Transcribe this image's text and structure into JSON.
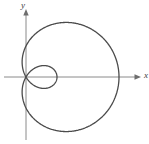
{
  "figure": {
    "name": "polar-limacon-plot",
    "width": 149,
    "height": 144,
    "background": "#ffffff"
  },
  "axes": {
    "x_axis": {
      "label": "x",
      "color": "#8a8a8a",
      "start_x": 4,
      "end_x": 141,
      "y": 77,
      "arrow": "right"
    },
    "y_axis": {
      "label": "y",
      "color": "#8a8a8a",
      "x": 26,
      "start_y": 140,
      "end_y": 9,
      "arrow": "up"
    },
    "origin": {
      "x": 26,
      "y": 77
    }
  },
  "curve": {
    "name": "limacon-with-inner-loop",
    "color": "#4b4b4b",
    "stroke_width": 1.3,
    "fill": "none"
  },
  "chart_data": {
    "type": "line",
    "title": "",
    "xlabel": "x",
    "ylabel": "y",
    "grid": false,
    "legend": null,
    "coordinate_system": "polar",
    "equation": "r = a + b cos(theta), b > a  (limacon with inner loop)",
    "parameters": {
      "a": 1,
      "b": 2
    },
    "pixels_per_unit": 31,
    "origin_px": [
      26,
      77
    ],
    "theta_range_deg": [
      0,
      360
    ],
    "outer_extent_px": {
      "left": 20,
      "right": 119,
      "top": 21,
      "bottom": 133
    },
    "inner_loop_extent_px": {
      "left": 26,
      "right": 58,
      "top": 62,
      "bottom": 92
    },
    "points_polar": [
      {
        "theta_deg": 0,
        "r": 3.0
      },
      {
        "theta_deg": 30,
        "r": 2.73
      },
      {
        "theta_deg": 60,
        "r": 2.0
      },
      {
        "theta_deg": 90,
        "r": 1.0
      },
      {
        "theta_deg": 120,
        "r": 0.0
      },
      {
        "theta_deg": 150,
        "r": -0.73
      },
      {
        "theta_deg": 180,
        "r": -1.0
      },
      {
        "theta_deg": 210,
        "r": -0.73
      },
      {
        "theta_deg": 240,
        "r": 0.0
      },
      {
        "theta_deg": 270,
        "r": 1.0
      },
      {
        "theta_deg": 300,
        "r": 2.0
      },
      {
        "theta_deg": 330,
        "r": 2.73
      },
      {
        "theta_deg": 360,
        "r": 3.0
      }
    ]
  }
}
